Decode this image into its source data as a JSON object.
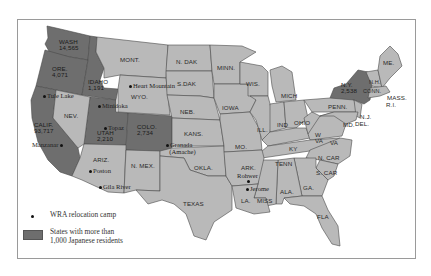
{
  "map": {
    "states_light": [
      "MONT.",
      "N. DAK",
      "S.DAK",
      "WYO.",
      "NEB.",
      "KANS.",
      "N. MEX.",
      "ARIZ.",
      "NEV.",
      "OKLA.",
      "TEXAS",
      "MINN.",
      "WIS.",
      "IOWA",
      "MO.",
      "ILL.",
      "MICH",
      "IND",
      "OHIO",
      "KY",
      "W VA",
      "VA",
      "TENN",
      "N. CAR",
      "S. CAR",
      "GA.",
      "ALA.",
      "MISS",
      "LA.",
      "ARK.",
      "FLA",
      "PENN.",
      "N.J.",
      "DEL.",
      "MD.",
      "CONN.",
      "MASS.",
      "R.I.",
      "N.H.",
      "VT.",
      "ME."
    ],
    "states_dark": [
      {
        "name": "WASH",
        "population": "14,565"
      },
      {
        "name": "ORE.",
        "population": "4,071"
      },
      {
        "name": "IDAHO",
        "population": "1,191"
      },
      {
        "name": "CALIF.",
        "population": "93,717"
      },
      {
        "name": "UTAH",
        "population": "2,210"
      },
      {
        "name": "COLO.",
        "population": "2,734"
      },
      {
        "name": "N.Y.",
        "population": "2,538"
      }
    ],
    "camps": [
      "Tule Lake",
      "Minidoka",
      "Heart Mountain",
      "Topaz",
      "Manzanar",
      "Poston",
      "Gila River",
      "Granada",
      "(Amache)",
      "Rohwer",
      "Jerome"
    ],
    "colors": {
      "dark_state": "#6e6e6e",
      "light_state": "#b9b9b9",
      "background": "#ffffff"
    }
  },
  "legend": {
    "camp_label": "WRA relocation camp",
    "shade_label_line1": "States with more than",
    "shade_label_line2": "1,000 Japanese residents"
  },
  "labels": {
    "mont": "MONT.",
    "ndak": "N. DAK",
    "sdak": "S.DAK",
    "wyo": "WYO.",
    "neb": "NEB.",
    "kans": "KANS.",
    "nmex": "N. MEX.",
    "ariz": "ARIZ.",
    "nev": "NEV.",
    "okla": "OKLA.",
    "texas": "TEXAS",
    "minn": "MINN.",
    "wis": "WIS.",
    "iowa": "IOWA",
    "mo": "MO.",
    "ill": "ILL.",
    "mich": "MICH",
    "ind": "IND",
    "ohio": "OHIO",
    "ky": "KY",
    "wva": "W VA",
    "va": "VA",
    "tenn": "TENN",
    "ncar": "N. CAR",
    "scar": "S. CAR",
    "ga": "GA.",
    "ala": "ALA.",
    "miss": "MISS",
    "la": "LA.",
    "ark": "ARK.",
    "fla": "FLA",
    "penn": "PENN.",
    "nj": "N.J.",
    "del": "DEL.",
    "md": "MD.",
    "conn": "CONN.",
    "mass": "MASS.",
    "ri": "R.I.",
    "nh": "N.H.",
    "me": "ME."
  }
}
